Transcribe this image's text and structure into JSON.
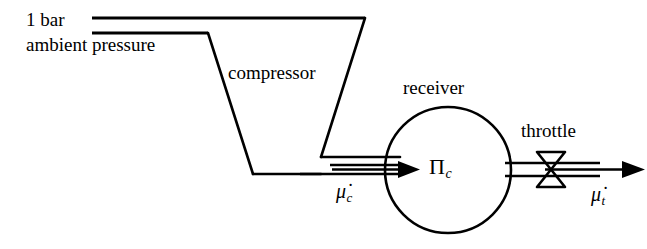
{
  "diagram": {
    "stroke_color": "#000000",
    "background_color": "#ffffff",
    "labels": {
      "pressure_line1": "1 bar",
      "pressure_line2": "ambient pressure",
      "compressor": "compressor",
      "receiver": "receiver",
      "throttle": "throttle",
      "receiver_pressure_symbol": "Π",
      "receiver_pressure_subscript": "c",
      "compressor_flow_symbol": "μ̇",
      "compressor_flow_subscript": "c",
      "throttle_flow_symbol": "μ̇",
      "throttle_flow_subscript": "t"
    },
    "components": [
      {
        "name": "intake-pipe",
        "type": "double-line",
        "from_x": 92,
        "to_x": 365,
        "upper_y": 18,
        "lower_y": 33
      },
      {
        "name": "compressor-body",
        "type": "trapezoid",
        "top_left_x": 208,
        "top_right_x": 365,
        "top_y": 18,
        "bottom_left_x": 253,
        "bottom_right_x": 320,
        "bottom_y": 174
      },
      {
        "name": "compressor-outlet-pipe",
        "type": "double-line",
        "from_x": 320,
        "to_x": 400,
        "upper_y": 165,
        "lower_y": 173
      },
      {
        "name": "receiver-vessel",
        "type": "circle",
        "center_x": 448,
        "center_y": 170,
        "radius": 63
      },
      {
        "name": "throttle-valve",
        "type": "bowtie",
        "center_x": 551,
        "center_y": 169,
        "half_width": 14,
        "half_height": 17
      },
      {
        "name": "receiver-outlet-pipe",
        "type": "double-line",
        "from_x": 505,
        "to_x": 645,
        "upper_y": 165,
        "lower_y": 173
      },
      {
        "name": "inlet-flow-arrow",
        "type": "arrow",
        "from_x": 330,
        "to_x": 408,
        "y": 169
      },
      {
        "name": "outlet-flow-arrow",
        "type": "arrow",
        "from_x": 545,
        "to_x": 645,
        "y": 169
      }
    ]
  }
}
